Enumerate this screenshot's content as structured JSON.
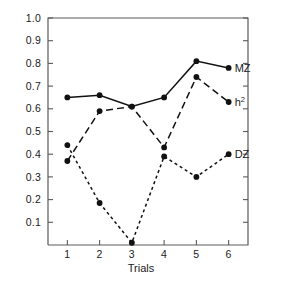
{
  "chart_data": {
    "type": "line",
    "title": "",
    "xlabel": "Trials",
    "ylabel": "",
    "x": [
      1,
      2,
      3,
      4,
      5,
      6
    ],
    "categories": [
      "1",
      "2",
      "3",
      "4",
      "5",
      "6"
    ],
    "xlim": [
      0.4,
      6.6
    ],
    "ylim": [
      0.0,
      1.0
    ],
    "xticks": [
      "1",
      "2",
      "3",
      "4",
      "5",
      "6"
    ],
    "yticks": [
      "0.1",
      "0.2",
      "0.3",
      "0.4",
      "0.5",
      "0.6",
      "0.7",
      "0.8",
      "0.9",
      "1.0"
    ],
    "ytick_values": [
      0.1,
      0.2,
      0.3,
      0.4,
      0.5,
      0.6,
      0.7,
      0.8,
      0.9,
      1.0
    ],
    "grid": false,
    "legend_position": "right-inline-labels",
    "series": [
      {
        "name": "MZ",
        "label": "MZ",
        "label_sup": "",
        "linestyle": "solid",
        "color": "#111111",
        "values": [
          0.65,
          0.66,
          0.61,
          0.65,
          0.81,
          0.78
        ]
      },
      {
        "name": "h2",
        "label": "h",
        "label_sup": "2",
        "linestyle": "long-dash",
        "color": "#111111",
        "values": [
          0.37,
          0.59,
          0.61,
          0.43,
          0.74,
          0.63
        ]
      },
      {
        "name": "DZ",
        "label": "DZ",
        "label_sup": "",
        "linestyle": "short-dash",
        "color": "#111111",
        "values": [
          0.44,
          0.185,
          0.01,
          0.39,
          0.3,
          0.4
        ]
      }
    ]
  },
  "axes": {
    "x_axis_title": "Trials",
    "y_tick_labels": [
      "1.0",
      "0.9",
      "0.8",
      "0.7",
      "0.6",
      "0.5",
      "0.4",
      "0.3",
      "0.2",
      "0.1"
    ],
    "x_tick_labels": [
      "1",
      "2",
      "3",
      "4",
      "5",
      "6"
    ]
  },
  "labels": {
    "mz": "MZ",
    "h2_base": "h",
    "h2_sup": "2",
    "dz": "DZ"
  }
}
